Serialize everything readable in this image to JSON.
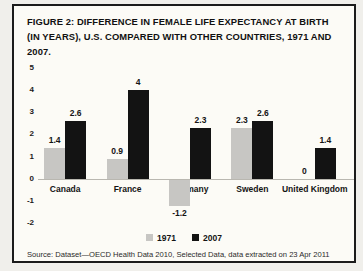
{
  "figure": {
    "title": "FIGURE 2: DIFFERENCE IN FEMALE LIFE EXPECTANCY AT BIRTH (IN YEARS), U.S. COMPARED WITH OTHER COUNTRIES, 1971 AND 2007.",
    "source": "Source: Dataset—OECD Health Data 2010, Selected Data, data extracted on 23 Apr 2011 12:19 UTC (GMT) from OECD.Stat."
  },
  "chart_data": {
    "type": "bar",
    "categories": [
      "Canada",
      "France",
      "Germany",
      "Sweden",
      "United Kingdom"
    ],
    "series": [
      {
        "name": "1971",
        "color": "#c7c6c3",
        "values": [
          1.4,
          0.9,
          -1.2,
          2.3,
          0
        ]
      },
      {
        "name": "2007",
        "color": "#131313",
        "values": [
          2.6,
          4,
          2.3,
          2.6,
          1.4
        ]
      }
    ],
    "title": "FIGURE 2: DIFFERENCE IN FEMALE LIFE EXPECTANCY AT BIRTH (IN YEARS), U.S. COMPARED WITH OTHER COUNTRIES, 1971 AND 2007.",
    "xlabel": "",
    "ylabel": "",
    "ylim": [
      -2,
      5
    ],
    "yticks": [
      5,
      4,
      3,
      2,
      1,
      0,
      -1,
      -2
    ],
    "grid": false,
    "legend_position": "bottom",
    "value_labels": true
  }
}
